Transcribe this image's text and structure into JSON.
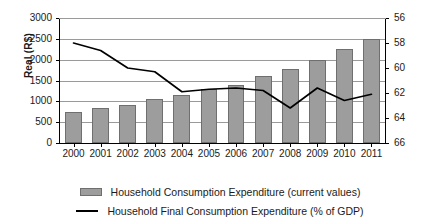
{
  "chart_data": {
    "type": "bar",
    "title": "",
    "xlabel": "",
    "ylabel": "Real (R$)",
    "ylabel_right": "",
    "grid": true,
    "legend_position": "bottom",
    "categories": [
      "2000",
      "2001",
      "2002",
      "2003",
      "2004",
      "2005",
      "2006",
      "2007",
      "2008",
      "2009",
      "2010",
      "2011"
    ],
    "ylim": [
      0,
      3000
    ],
    "yticks": [
      "0",
      "500",
      "1000",
      "1500",
      "2000",
      "2500",
      "3000"
    ],
    "ylim_right": [
      66,
      56
    ],
    "yticks_right": [
      "56",
      "58",
      "60",
      "62",
      "64",
      "66"
    ],
    "right_axis_inverted": true,
    "series": [
      {
        "name": "Household Consumption Expenditure (current values)",
        "type": "bar",
        "axis": "left",
        "color": "#9d9d9d",
        "values": [
          750,
          840,
          920,
          1050,
          1160,
          1300,
          1400,
          1600,
          1780,
          2000,
          2250,
          2500
        ]
      },
      {
        "name": "Household Final Consumption Expenditure (% of GDP)",
        "type": "line",
        "axis": "right",
        "color": "#000000",
        "values": [
          58.0,
          58.6,
          60.0,
          60.3,
          61.9,
          61.7,
          61.6,
          61.8,
          63.2,
          61.6,
          62.6,
          62.1
        ]
      }
    ],
    "legend": [
      {
        "label": "Household Consumption Expenditure (current values)",
        "marker": "swatch"
      },
      {
        "label": "Household Final Consumption Expenditure (% of GDP)",
        "marker": "line"
      }
    ]
  }
}
